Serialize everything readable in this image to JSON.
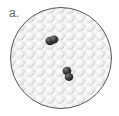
{
  "panel_label": "a.",
  "illustration": {
    "description": "Circular field of white spheres with two dark particles",
    "circle": {
      "cx": 61,
      "cy": 58,
      "r": 51,
      "fill": "#ebebeb",
      "stroke": "#555555"
    },
    "particles": [
      {
        "name": "dark-particle-1",
        "cx": 51,
        "cy": 40,
        "color": "#3a3a3a"
      },
      {
        "name": "dark-particle-2",
        "cx": 68,
        "cy": 74,
        "color": "#3a3a3a"
      }
    ]
  }
}
